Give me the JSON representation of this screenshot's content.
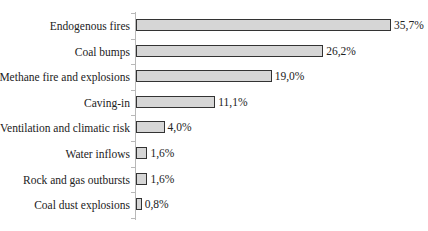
{
  "chart_data": {
    "type": "bar",
    "orientation": "horizontal",
    "title": "",
    "xlabel": "",
    "ylabel": "",
    "categories": [
      "Endogenous fires",
      "Coal bumps",
      "Methane fire and explosions",
      "Caving-in",
      "Ventilation and climatic risk",
      "Water inflows",
      "Rock and gas outbursts",
      "Coal dust explosions"
    ],
    "values": [
      35.7,
      26.2,
      19.0,
      11.1,
      4.0,
      1.6,
      1.6,
      0.8
    ],
    "value_labels": [
      "35,7%",
      "26,2%",
      "19,0%",
      "11,1%",
      "4,0%",
      "1,6%",
      "1,6%",
      "0,8%"
    ],
    "unit": "%",
    "xlim": [
      0,
      40
    ],
    "grid": false,
    "legend": null,
    "colors": {
      "bar_fill": "#d6d6d6",
      "bar_border": "#333333",
      "axis": "#b8b8b8"
    }
  }
}
